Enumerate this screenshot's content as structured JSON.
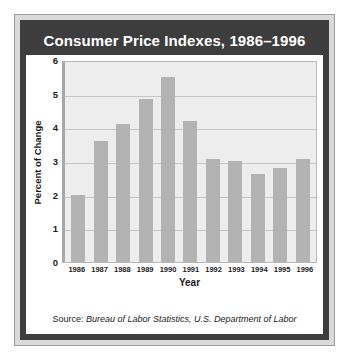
{
  "chart_data": {
    "type": "bar",
    "title": "Consumer Price Indexes, 1986–1996",
    "xlabel": "Year",
    "ylabel": "Percent of Change",
    "categories": [
      "1986",
      "1987",
      "1988",
      "1989",
      "1990",
      "1991",
      "1992",
      "1993",
      "1994",
      "1995",
      "1996"
    ],
    "values": [
      2.0,
      3.6,
      4.1,
      4.85,
      5.5,
      4.2,
      3.05,
      3.0,
      2.6,
      2.8,
      3.05
    ],
    "ylim": [
      0,
      6
    ],
    "yticks": [
      0,
      1,
      2,
      3,
      4,
      5,
      6
    ],
    "grid": true,
    "legend": null,
    "bar_color": "#b3b3b3",
    "plot_background": "#ededed",
    "title_background": "#3d3d3d",
    "title_color": "#ffffff"
  },
  "source": {
    "label": "Source: ",
    "text": "Bureau of Labor Statistics, U.S. Department of Labor"
  }
}
